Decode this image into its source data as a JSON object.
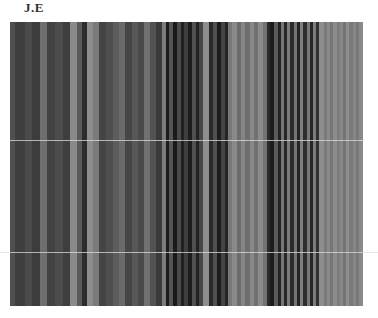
{
  "label": "J.E",
  "panel": {
    "left": 10,
    "top": 22,
    "width": 354,
    "height": 284
  },
  "stripes": [
    {
      "w": 5,
      "c": "#505050"
    },
    {
      "w": 9,
      "c": "#3e3e3e"
    },
    {
      "w": 6,
      "c": "#4a4a4a"
    },
    {
      "w": 8,
      "c": "#3c3c3c"
    },
    {
      "w": 6,
      "c": "#6e6e6e"
    },
    {
      "w": 8,
      "c": "#424242"
    },
    {
      "w": 7,
      "c": "#4c4c4c"
    },
    {
      "w": 7,
      "c": "#3e3e3e"
    },
    {
      "w": 6,
      "c": "#8a8a8a"
    },
    {
      "w": 5,
      "c": "#5a5a5a"
    },
    {
      "w": 5,
      "c": "#2c2c2c"
    },
    {
      "w": 5,
      "c": "#8c8c8c"
    },
    {
      "w": 6,
      "c": "#7a7a7a"
    },
    {
      "w": 6,
      "c": "#444444"
    },
    {
      "w": 7,
      "c": "#4e4e4e"
    },
    {
      "w": 5,
      "c": "#5c5c5c"
    },
    {
      "w": 6,
      "c": "#6a6a6a"
    },
    {
      "w": 6,
      "c": "#464646"
    },
    {
      "w": 6,
      "c": "#585858"
    },
    {
      "w": 6,
      "c": "#4a4a4a"
    },
    {
      "w": 5,
      "c": "#707070"
    },
    {
      "w": 6,
      "c": "#525252"
    },
    {
      "w": 5,
      "c": "#3a3a3a"
    },
    {
      "w": 4,
      "c": "#7c7c7c"
    },
    {
      "w": 3,
      "c": "#1c1c1c"
    },
    {
      "w": 4,
      "c": "#555555"
    },
    {
      "w": 3,
      "c": "#1a1a1a"
    },
    {
      "w": 4,
      "c": "#4a4a4a"
    },
    {
      "w": 3,
      "c": "#202020"
    },
    {
      "w": 4,
      "c": "#3e3e3e"
    },
    {
      "w": 3,
      "c": "#1e1e1e"
    },
    {
      "w": 4,
      "c": "#505050"
    },
    {
      "w": 3,
      "c": "#222222"
    },
    {
      "w": 4,
      "c": "#464646"
    },
    {
      "w": 5,
      "c": "#8e8e8e"
    },
    {
      "w": 4,
      "c": "#2a2a2a"
    },
    {
      "w": 4,
      "c": "#505050"
    },
    {
      "w": 3,
      "c": "#1c1c1c"
    },
    {
      "w": 4,
      "c": "#444444"
    },
    {
      "w": 3,
      "c": "#262626"
    },
    {
      "w": 4,
      "c": "#777777"
    },
    {
      "w": 4,
      "c": "#8a8a8a"
    },
    {
      "w": 4,
      "c": "#6c6c6c"
    },
    {
      "w": 4,
      "c": "#868686"
    },
    {
      "w": 4,
      "c": "#6e6e6e"
    },
    {
      "w": 4,
      "c": "#888888"
    },
    {
      "w": 4,
      "c": "#707070"
    },
    {
      "w": 4,
      "c": "#8c8c8c"
    },
    {
      "w": 4,
      "c": "#727272"
    },
    {
      "w": 3,
      "c": "#2a2a2a"
    },
    {
      "w": 4,
      "c": "#1c1c1c"
    },
    {
      "w": 3,
      "c": "#5a5a5a"
    },
    {
      "w": 3,
      "c": "#222222"
    },
    {
      "w": 3,
      "c": "#767676"
    },
    {
      "w": 3,
      "c": "#262626"
    },
    {
      "w": 3,
      "c": "#7a7a7a"
    },
    {
      "w": 3,
      "c": "#2c2c2c"
    },
    {
      "w": 3,
      "c": "#747474"
    },
    {
      "w": 3,
      "c": "#242424"
    },
    {
      "w": 3,
      "c": "#7e7e7e"
    },
    {
      "w": 3,
      "c": "#2e2e2e"
    },
    {
      "w": 3,
      "c": "#787878"
    },
    {
      "w": 3,
      "c": "#262626"
    },
    {
      "w": 3,
      "c": "#7c7c7c"
    },
    {
      "w": 3,
      "c": "#303030"
    },
    {
      "w": 4,
      "c": "#8e8e8e"
    },
    {
      "w": 3,
      "c": "#7a7a7a"
    },
    {
      "w": 3,
      "c": "#8a8a8a"
    },
    {
      "w": 3,
      "c": "#767676"
    },
    {
      "w": 3,
      "c": "#8c8c8c"
    },
    {
      "w": 3,
      "c": "#7c7c7c"
    },
    {
      "w": 3,
      "c": "#888888"
    },
    {
      "w": 3,
      "c": "#747474"
    },
    {
      "w": 3,
      "c": "#8e8e8e"
    },
    {
      "w": 3,
      "c": "#7a7a7a"
    },
    {
      "w": 3,
      "c": "#868686"
    },
    {
      "w": 3,
      "c": "#787878"
    },
    {
      "w": 4,
      "c": "#8a8a8a"
    }
  ],
  "lines": [
    {
      "y": 140,
      "left": 10,
      "width": 354
    },
    {
      "y": 252,
      "left": 0,
      "width": 378
    }
  ]
}
